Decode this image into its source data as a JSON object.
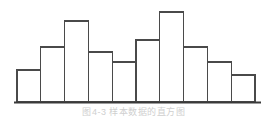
{
  "figure": {
    "caption": "图4-3  样本数据的直方图",
    "caption_visible": "partially cropped at bottom edge"
  },
  "chart_data": {
    "type": "bar",
    "title": "",
    "subtitle": "",
    "xlabel": "",
    "ylabel": "",
    "categories": [
      "1",
      "2",
      "3",
      "4",
      "5",
      "6",
      "7",
      "8",
      "9",
      "10"
    ],
    "values": [
      32,
      55,
      81,
      50,
      40,
      62,
      90,
      55,
      40,
      27
    ],
    "ylim": [
      0,
      96
    ],
    "xlim": [
      0,
      10
    ],
    "grid": false,
    "legend": null,
    "legend_position": "none",
    "annotations": [],
    "tick_labels_x": [],
    "tick_labels_y": [],
    "style": {
      "bar_fill": "#ffffff",
      "bar_stroke": "#4a4a4a",
      "bar_stroke_width": 1.3,
      "axis_color": "#3a3a3a",
      "axis_width": 1.6,
      "background": "#ffffff"
    },
    "geometry": {
      "baseline_y": 102,
      "plot_left": 17,
      "plot_right": 255,
      "bar_width": 23.8,
      "bar_tops_px": [
        70,
        47,
        21,
        52,
        62,
        40,
        12,
        47,
        62,
        75
      ],
      "axis_extend_right": 261
    }
  }
}
